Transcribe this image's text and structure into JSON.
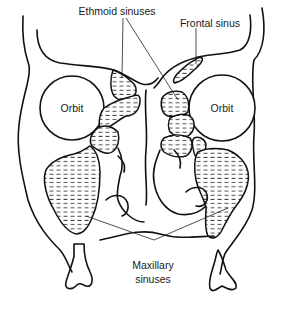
{
  "figure": {
    "labels": {
      "ethmoid": "Ethmoid sinuses",
      "frontal": "Frontal sinus",
      "orbit_left": "Orbit",
      "orbit_right": "Orbit",
      "maxillary_line1": "Maxillary",
      "maxillary_line2": "sinuses"
    },
    "colors": {
      "line": "#111111",
      "background": "#ffffff",
      "hatch": "#333333"
    }
  }
}
